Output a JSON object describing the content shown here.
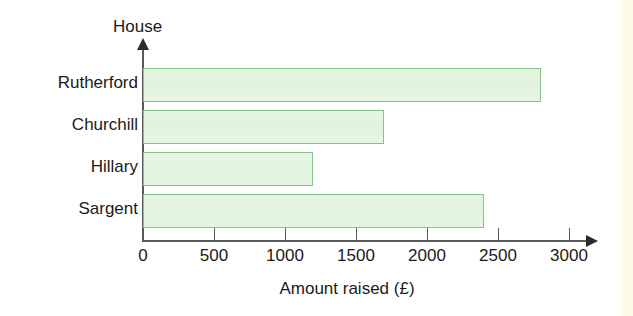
{
  "chart_data": {
    "type": "bar",
    "orientation": "horizontal",
    "title": "",
    "xlabel": "Amount raised (£)",
    "ylabel": "House",
    "categories": [
      "Rutherford",
      "Churchill",
      "Hillary",
      "Sargent"
    ],
    "values": [
      2800,
      1700,
      1200,
      2400
    ],
    "xticks": [
      0,
      500,
      1000,
      1500,
      2000,
      2500,
      3000
    ],
    "xtick_labels": [
      "0",
      "500",
      "1000",
      "1500",
      "2000",
      "2500",
      "3000"
    ],
    "xlim": [
      0,
      3000
    ],
    "grid": false,
    "legend": null,
    "colors": {
      "bar_fill": "#e3f4e0",
      "bar_border": "#86c188",
      "axis": "#5a5a5a",
      "text": "#1a1a1a",
      "background": "#ffffff"
    }
  }
}
